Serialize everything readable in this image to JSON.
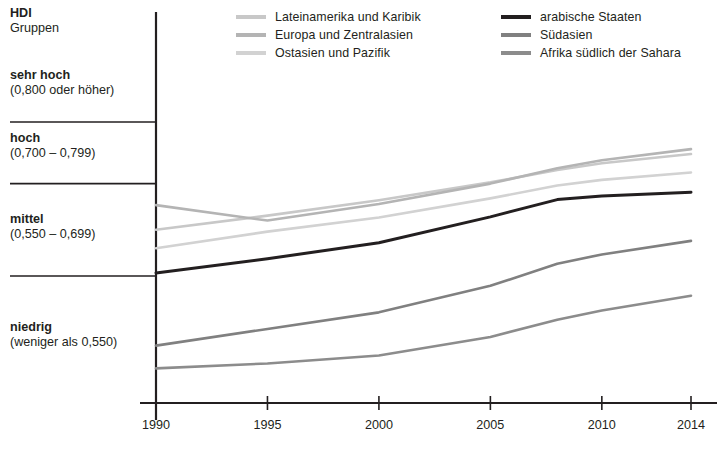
{
  "chart_data": {
    "type": "line",
    "title": "",
    "xlabel": "",
    "ylabel": "HDI Gruppen",
    "x": [
      1990,
      1995,
      2000,
      2005,
      2008,
      2010,
      2014
    ],
    "xlim": [
      1989,
      2015
    ],
    "ylim": [
      0.355,
      0.815
    ],
    "grid": true,
    "gridlines": [
      0.8,
      0.7,
      0.55
    ],
    "legend_position": "top",
    "xtick_labels": [
      "1990",
      "1995",
      "2000",
      "2005",
      "2010",
      "2014"
    ],
    "xtick_values": [
      1990,
      1995,
      2000,
      2005,
      2010,
      2014
    ],
    "series": [
      {
        "name": "Lateinamerika und Karibik",
        "color": "#c8c8c8",
        "values": [
          0.625,
          0.648,
          0.673,
          0.702,
          0.722,
          0.733,
          0.748
        ]
      },
      {
        "name": "Europa und Zentralasien",
        "color": "#b4b4b4",
        "values": [
          0.665,
          0.64,
          0.667,
          0.7,
          0.725,
          0.738,
          0.756
        ]
      },
      {
        "name": "Ostasien und Pazifik",
        "color": "#d2d2d2",
        "values": [
          0.595,
          0.622,
          0.645,
          0.676,
          0.697,
          0.706,
          0.718
        ]
      },
      {
        "name": "arabische Staaten",
        "color": "#231f20",
        "values": [
          0.555,
          0.578,
          0.604,
          0.646,
          0.674,
          0.68,
          0.686
        ]
      },
      {
        "name": "Südasien",
        "color": "#808080",
        "values": [
          0.437,
          0.464,
          0.491,
          0.534,
          0.57,
          0.585,
          0.607
        ]
      },
      {
        "name": "Afrika südlich der Sahara",
        "color": "#8c8c8c",
        "values": [
          0.4,
          0.408,
          0.421,
          0.451,
          0.479,
          0.494,
          0.518
        ]
      }
    ]
  },
  "axis_title": {
    "line1": "HDI",
    "line2": "Gruppen"
  },
  "hdi_bands": [
    {
      "name": "sehr hoch",
      "range": "(0,800 oder höher)"
    },
    {
      "name": "hoch",
      "range": "(0,700 – 0,799)"
    },
    {
      "name": "mittel",
      "range": "(0,550 – 0,699)"
    },
    {
      "name": "niedrig",
      "range": "(weniger als 0,550)"
    }
  ],
  "legend": {
    "left_column": [
      {
        "label": "Lateinamerika und Karibik",
        "color": "#c8c8c8"
      },
      {
        "label": "Europa und Zentralasien",
        "color": "#b4b4b4"
      },
      {
        "label": "Ostasien und Pazifik",
        "color": "#d2d2d2"
      }
    ],
    "right_column": [
      {
        "label": "arabische Staaten",
        "color": "#231f20"
      },
      {
        "label": "Südasien",
        "color": "#808080"
      },
      {
        "label": "Afrika südlich der Sahara",
        "color": "#8c8c8c"
      }
    ]
  },
  "colors": {
    "axis": "#231f20",
    "gridline": "#231f20",
    "background": "#ffffff"
  }
}
